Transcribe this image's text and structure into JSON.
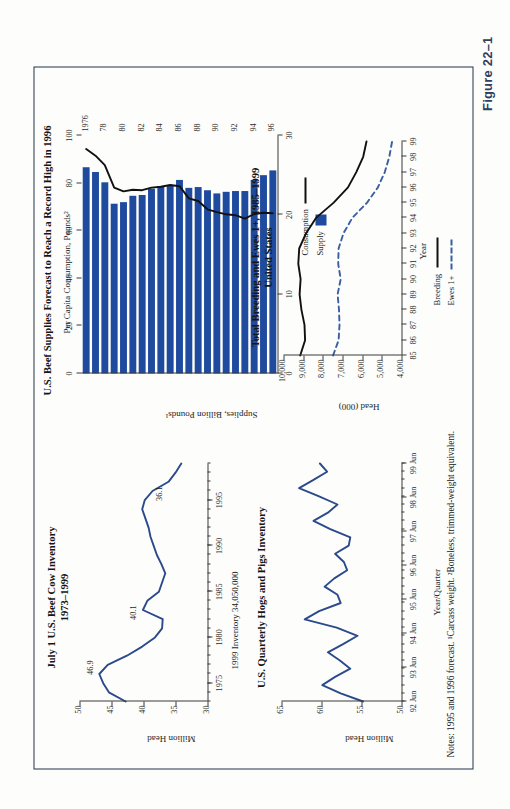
{
  "figure": {
    "label": "Figure 22–1"
  },
  "notes": {
    "text": "Notes: 1995 and 1996 forecast. ¹Carcass weight. ²Boneless, trimmed-weight equivalent."
  },
  "colors": {
    "line_blue": "#2b4a8b",
    "bar_blue": "#1f4b9e",
    "black": "#111111",
    "axis": "#3a3a3a",
    "frame": "#23324d",
    "figlabel": "#2c3f63"
  },
  "chart_data": [
    {
      "id": "beef-cow-inventory",
      "type": "line",
      "title": "July 1 U.S. Beef Cow Inventory",
      "subtitle": "1973–1999",
      "xlabel": "1999 Inventory 34,050,000",
      "ylabel": "Million Head",
      "ylim": [
        30,
        50
      ],
      "yticks": [
        30,
        35,
        40,
        45,
        50
      ],
      "ytick_labels": [
        "30",
        "35",
        "40",
        "45",
        "50"
      ],
      "xlim": [
        1973,
        1999
      ],
      "xticks": [
        1975,
        1980,
        1985,
        1990,
        1995
      ],
      "xtick_labels": [
        "1975",
        "1980",
        "1985",
        "1990",
        "1995"
      ],
      "annotations": [
        {
          "text": "46.9",
          "x": 1977,
          "y": 46.9
        },
        {
          "text": "40.1",
          "x": 1983,
          "y": 40.1
        },
        {
          "text": "36.1",
          "x": 1996,
          "y": 36.1
        }
      ],
      "x": [
        1973,
        1974,
        1975,
        1976,
        1977,
        1978,
        1979,
        1980,
        1981,
        1982,
        1983,
        1984,
        1985,
        1986,
        1987,
        1988,
        1989,
        1990,
        1991,
        1992,
        1993,
        1994,
        1995,
        1996,
        1997,
        1998,
        1999
      ],
      "values": [
        42.8,
        45.4,
        46.3,
        46.9,
        45.6,
        42.6,
        40.2,
        38.2,
        37.1,
        37.0,
        40.1,
        39.4,
        37.6,
        37.1,
        36.6,
        37.2,
        37.9,
        38.4,
        38.9,
        39.2,
        39.7,
        40.2,
        39.8,
        38.6,
        36.1,
        35.0,
        34.1
      ],
      "grid": false
    },
    {
      "id": "beef-supplies-consumption",
      "type": "bar",
      "title": "U.S. Beef Supplies Forecast to Reach a Record High in 1996",
      "ylabel": "Supplies, Billion Pounds¹",
      "y2label": "Per Capita Consumption, Pounds²",
      "ylim": [
        0,
        30
      ],
      "yticks": [
        0,
        10,
        20,
        30
      ],
      "ytick_labels": [
        "0",
        "10",
        "20",
        "30"
      ],
      "y2lim": [
        0,
        100
      ],
      "y2ticks": [
        0,
        20,
        40,
        60,
        80,
        100
      ],
      "y2tick_labels": [
        "0",
        "20",
        "40",
        "60",
        "80",
        "100"
      ],
      "categories": [
        "1976",
        "77",
        "78",
        "79",
        "80",
        "81",
        "82",
        "83",
        "84",
        "85",
        "86",
        "87",
        "88",
        "89",
        "90",
        "91",
        "92",
        "93",
        "94",
        "95",
        "96"
      ],
      "xtick_labels": [
        "1976",
        "78",
        "80",
        "82",
        "84",
        "86",
        "88",
        "90",
        "92",
        "94",
        "96"
      ],
      "series": [
        {
          "name": "Supply",
          "kind": "bar",
          "unit": "Billion Pounds",
          "values": [
            26.0,
            25.4,
            24.1,
            21.4,
            21.6,
            22.4,
            22.5,
            23.3,
            23.6,
            23.7,
            24.4,
            23.4,
            23.5,
            23.1,
            22.7,
            22.9,
            23.0,
            23.0,
            24.4,
            25.0,
            25.6
          ]
        },
        {
          "name": "Consumption",
          "kind": "line",
          "unit": "Pounds per capita",
          "values": [
            94.3,
            91.5,
            87.5,
            78.1,
            76.5,
            77.2,
            77.0,
            78.1,
            78.5,
            79.2,
            78.7,
            73.6,
            72.5,
            69.0,
            67.8,
            66.9,
            66.5,
            65.1,
            67.0,
            67.5,
            67.3
          ]
        }
      ],
      "legend": [
        {
          "label": "Consumption",
          "style": "line",
          "color": "#111111"
        },
        {
          "label": "Supply",
          "style": "swatch",
          "color": "#1f4b9e"
        }
      ],
      "grid": false
    },
    {
      "id": "hogs-and-pigs-inventory",
      "type": "line",
      "title": "U.S. Quarterly Hogs and Pigs Inventory",
      "xlabel": "Year/Quarter",
      "ylabel": "Million Head",
      "ylim": [
        50,
        65
      ],
      "yticks": [
        50,
        55,
        60,
        65
      ],
      "ytick_labels": [
        "50",
        "55",
        "60",
        "65"
      ],
      "xtick_labels": [
        "92 Jun",
        "93 Jun",
        "94 Jun",
        "95 Jun",
        "96 Jun",
        "97 Jun",
        "98 Jun",
        "99 Jun"
      ],
      "x": [
        0,
        1,
        2,
        3,
        4,
        5,
        6,
        7,
        8,
        9,
        10,
        11,
        12,
        13,
        14,
        15,
        16,
        17,
        18,
        19,
        20,
        21,
        22,
        23,
        24,
        25,
        26,
        27,
        28,
        29
      ],
      "values": [
        54.8,
        57.6,
        59.9,
        58.3,
        56.4,
        57.7,
        59.2,
        57.3,
        55.5,
        58.1,
        62.1,
        60.3,
        57.6,
        58.0,
        59.6,
        58.4,
        56.8,
        57.2,
        58.3,
        56.6,
        56.4,
        58.9,
        61.0,
        59.2,
        58.0,
        60.3,
        62.8,
        61.0,
        59.3,
        60.2
      ],
      "grid": false
    },
    {
      "id": "breeding-and-ewes",
      "type": "line",
      "title": "Total Breeding and Ewes 1+, 1985–1999",
      "subtitle": "United States",
      "xlabel": "Year",
      "ylabel": "Head (000)",
      "ylim": [
        4000,
        10000
      ],
      "yticks": [
        4000,
        5000,
        6000,
        7000,
        8000,
        9000,
        10000
      ],
      "ytick_labels": [
        "4,000",
        "5,000",
        "6,000",
        "7,000",
        "8,000",
        "9,000",
        "10,000"
      ],
      "categories": [
        "85",
        "86",
        "87",
        "88",
        "89",
        "90",
        "91",
        "92",
        "93",
        "94",
        "95",
        "96",
        "97",
        "98",
        "99"
      ],
      "xtick_labels": [
        "85",
        "86",
        "87",
        "88",
        "89",
        "90",
        "91",
        "92",
        "93",
        "94",
        "95",
        "96",
        "97",
        "98",
        "99"
      ],
      "series": [
        {
          "name": "Breeding",
          "style": "solid",
          "color": "#111111",
          "values": [
            9150,
            8900,
            8930,
            9090,
            9180,
            9130,
            9250,
            9200,
            8850,
            8350,
            7450,
            6720,
            6300,
            5950,
            5780
          ]
        },
        {
          "name": "Ewes 1+",
          "style": "dashed",
          "color": "#3b5ea3",
          "values": [
            7480,
            7200,
            7150,
            7180,
            7250,
            7090,
            7220,
            7200,
            6950,
            6500,
            5750,
            5200,
            4850,
            4620,
            4480
          ]
        }
      ],
      "legend": [
        {
          "label": "Breeding",
          "style": "solid",
          "color": "#111111"
        },
        {
          "label": "Ewes 1+",
          "style": "dashed",
          "color": "#3b5ea3"
        }
      ],
      "grid": false
    }
  ]
}
